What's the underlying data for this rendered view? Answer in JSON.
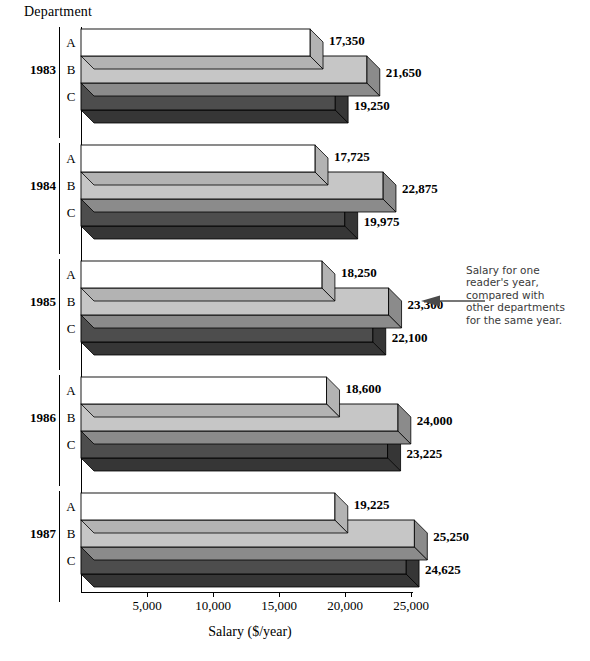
{
  "chart_data": {
    "type": "bar",
    "orientation": "horizontal",
    "title": "",
    "xlabel": "Salary ($/year)",
    "ylabel": "Department",
    "xlim": [
      0,
      27000
    ],
    "xticks": [
      5000,
      10000,
      15000,
      20000,
      25000
    ],
    "xticklabels": [
      "5,000",
      "10,000",
      "15,000",
      "20,000",
      "25,000"
    ],
    "grid": false,
    "legend": "none",
    "group_axis_label": "Department",
    "categories": [
      "1983",
      "1984",
      "1985",
      "1986",
      "1987"
    ],
    "series": [
      {
        "name": "A",
        "color": "#ffffff",
        "values": [
          17350,
          17725,
          18250,
          18600,
          19225
        ],
        "labels": [
          "17,350",
          "17,725",
          "18,250",
          "18,600",
          "19,225"
        ]
      },
      {
        "name": "B",
        "color": "#c6c6c6",
        "values": [
          21650,
          22875,
          23300,
          24000,
          25250
        ],
        "labels": [
          "21,650",
          "22,875",
          "23,300",
          "24,000",
          "25,250"
        ]
      },
      {
        "name": "C",
        "color": "#4d4d4d",
        "values": [
          19250,
          19975,
          22100,
          23225,
          24625
        ],
        "labels": [
          "19,250",
          "19,975",
          "22,100",
          "23,225",
          "24,625"
        ]
      }
    ],
    "annotations": [
      {
        "text": "Salary for one reader's year, compared with other departments for the same year.",
        "lines": [
          "Salary for one",
          "reader's year,",
          "compared with",
          "other departments",
          "for the same year."
        ],
        "points_to": {
          "category": "1985",
          "series": "B",
          "value": 23300
        },
        "arrow": "left"
      }
    ],
    "colors": {
      "series_a": "#ffffff",
      "series_b": "#c6c6c6",
      "series_c": "#4d4d4d",
      "outline": "#000000",
      "annotation_text": "#3a3a3a"
    }
  },
  "axis": {
    "y_title": "Department",
    "x_title": "Salary ($/year)",
    "ticks": [
      "5,000",
      "10,000",
      "15,000",
      "20,000",
      "25,000"
    ]
  },
  "groups": [
    {
      "year": "1983",
      "depts": [
        "A",
        "B",
        "C"
      ]
    },
    {
      "year": "1984",
      "depts": [
        "A",
        "B",
        "C"
      ]
    },
    {
      "year": "1985",
      "depts": [
        "A",
        "B",
        "C"
      ]
    },
    {
      "year": "1986",
      "depts": [
        "A",
        "B",
        "C"
      ]
    },
    {
      "year": "1987",
      "depts": [
        "A",
        "B",
        "C"
      ]
    }
  ],
  "annotation": {
    "line1": "Salary for one",
    "line2": "reader's year,",
    "line3": "compared with",
    "line4": "other departments",
    "line5": "for the same year."
  }
}
